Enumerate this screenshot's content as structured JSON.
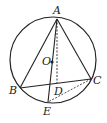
{
  "diagram": {
    "type": "geometry",
    "circle": {
      "label": "O",
      "cx": 53,
      "cy": 60,
      "r": 43
    },
    "points": {
      "A": {
        "label": "A",
        "x": 57,
        "y": 19
      },
      "B": {
        "label": "B",
        "x": 20,
        "y": 88
      },
      "C": {
        "label": "C",
        "x": 91,
        "y": 79
      },
      "D": {
        "label": "D",
        "x": 57,
        "y": 83
      },
      "E": {
        "label": "E",
        "x": 48,
        "y": 102
      },
      "O": {
        "label": "O",
        "x": 52,
        "y": 62
      }
    },
    "segments": [
      {
        "from": "A",
        "to": "B",
        "style": "solid"
      },
      {
        "from": "A",
        "to": "C",
        "style": "solid"
      },
      {
        "from": "B",
        "to": "C",
        "style": "solid"
      },
      {
        "from": "A",
        "to": "E",
        "style": "solid"
      },
      {
        "from": "A",
        "to": "D",
        "style": "dashed"
      },
      {
        "from": "C",
        "to": "E",
        "style": "dashed"
      }
    ],
    "colors": {
      "stroke": "#222222",
      "background": "#ffffff"
    }
  }
}
